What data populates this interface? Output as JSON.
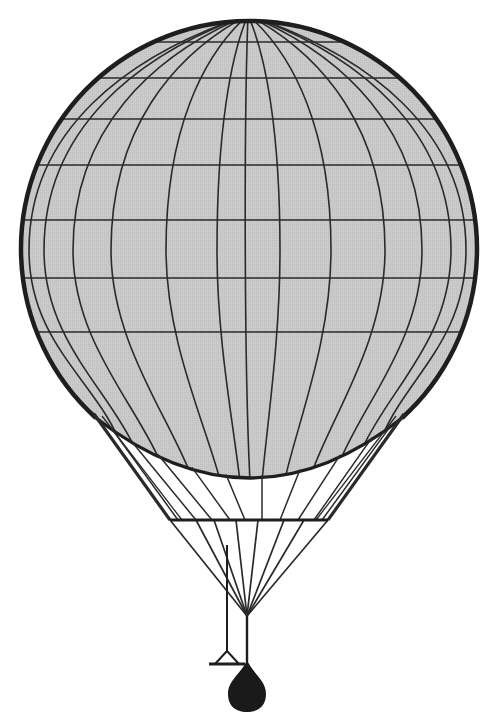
{
  "figure": {
    "colors": {
      "background": "#ffffff",
      "envelope_fill": "#c9c9c9",
      "line": "#2a2a2a",
      "outline": "#1e1e1e",
      "weight": "#1a1a1a"
    },
    "envelope": {
      "cx": 248,
      "cy": 243,
      "r": 228,
      "top": [
        248,
        15
      ],
      "bottom_arc": {
        "left": [
          96,
          418
        ],
        "mid": [
          250,
          478
        ],
        "right": [
          402,
          418
        ]
      },
      "latitudes_y": [
        42,
        78,
        119,
        165,
        220,
        278,
        332
      ],
      "meridians_equator_x": [
        29,
        44,
        73,
        111,
        166,
        217,
        280,
        331,
        385,
        422,
        451,
        466
      ],
      "meridians_bottom_x": [
        118,
        135,
        160,
        190,
        220,
        240,
        262,
        285,
        312,
        340,
        362,
        382
      ]
    },
    "load_ring": {
      "y": 520,
      "x1": 170,
      "x2": 328
    },
    "convergence_point": [
      247,
      616
    ],
    "side_rod": {
      "x": 227,
      "y1": 545,
      "y2": 651
    },
    "trail_triangle": {
      "apex": [
        227,
        651
      ],
      "base_left": [
        213,
        664
      ],
      "base_right": [
        241,
        664
      ]
    },
    "drop_weight": {
      "top": [
        247,
        660
      ],
      "bottom_y": 712,
      "half_width": 19
    }
  }
}
